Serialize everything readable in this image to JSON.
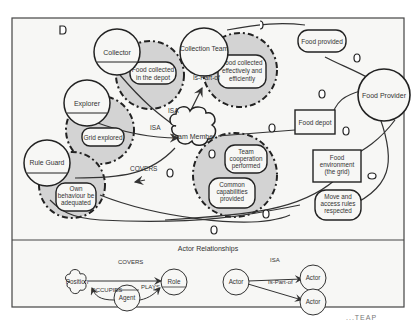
{
  "diagram": {
    "main": {
      "actors": {
        "collector": "Collector",
        "explorer": "Explorer",
        "rule_guard": "Rule Guard",
        "collection_team": "Collection Team",
        "team_member": "Team Member",
        "food_provider": "Food Provider"
      },
      "goals": {
        "food_collected_depot": [
          "Food collected",
          "in the depot"
        ],
        "grid_explored": "Grid explored",
        "own_behaviour": [
          "Own",
          "behaviour be",
          "adequated"
        ],
        "food_collected_effectively": [
          "Food collected",
          "effectively and",
          "efficiently"
        ],
        "team_cooperation": [
          "Team",
          "cooperation",
          "performed"
        ],
        "common_capabilities": [
          "Common",
          "capabilities",
          "provided"
        ],
        "food_provided": "Food provided",
        "move_access_rules": [
          "Move and",
          "access rules",
          "respected"
        ]
      },
      "resources": {
        "food_depot": "Food depot",
        "food_environment": [
          "Food",
          "environment",
          "(the grid)"
        ]
      },
      "link_labels": {
        "isa_collector": "ISA",
        "isa_explorer": "ISA",
        "is_part_of": "Is-Part-of",
        "covers": "COVERS"
      }
    },
    "legend": {
      "title": "Actor Relationships",
      "position": "Position",
      "role": "Role",
      "agent": "Agent",
      "covers": "COVERS",
      "occupies": "OCCUPIES",
      "plays": "PLAYS",
      "actor_a": "Actor",
      "actor_b": "Actor",
      "actor_c": "Actor",
      "isa": "ISA",
      "is_part_of": "Is-Part-of"
    }
  },
  "caption_fragment": "...TEAP"
}
